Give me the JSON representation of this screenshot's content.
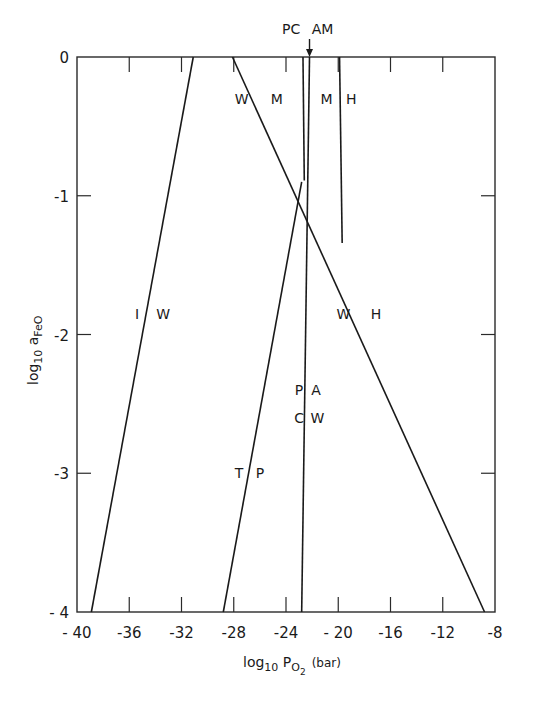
{
  "chart_data": {
    "type": "line",
    "title": "",
    "xlabel": "log10 PO2 (bar)",
    "xlabel_parts": {
      "main": "log",
      "sub1": "10",
      "mid": " P",
      "sub2": "O",
      "sub3": "2",
      "unit": "(bar)"
    },
    "ylabel": "log10 aFeO",
    "ylabel_parts": {
      "main": "log",
      "sub1": "10",
      "mid": " a",
      "sub2": "FeO"
    },
    "xlim": [
      -40,
      -8
    ],
    "ylim": [
      -4,
      0
    ],
    "grid": false,
    "x_ticks": [
      -40,
      -36,
      -32,
      -28,
      -24,
      -20,
      -16,
      -12,
      -8
    ],
    "x_tick_labels": [
      "- 40",
      "-36",
      "-32",
      "-28",
      "-24",
      "- 20",
      "-16",
      "-12",
      "-8"
    ],
    "y_ticks": [
      0,
      -1,
      -2,
      -3,
      -4
    ],
    "y_tick_labels": [
      "0",
      "-1",
      "-2",
      "-3",
      "- 4"
    ],
    "series": [
      {
        "name": "I/W boundary",
        "points": [
          [
            -31.1,
            0
          ],
          [
            -38.9,
            -4
          ]
        ]
      },
      {
        "name": "W/M - W/H boundary",
        "points": [
          [
            -28.1,
            0
          ],
          [
            -8.8,
            -4
          ]
        ]
      },
      {
        "name": "T/P boundary",
        "points": [
          [
            -22.8,
            -0.9
          ],
          [
            -28.8,
            -4
          ]
        ]
      },
      {
        "name": "PC/AM - PA/CW boundary",
        "points": [
          [
            -22.2,
            0
          ],
          [
            -22.8,
            -4
          ]
        ]
      },
      {
        "name": "W M / M boundary",
        "points": [
          [
            -22.7,
            0
          ],
          [
            -22.6,
            -0.89
          ]
        ]
      },
      {
        "name": "M/H boundary",
        "points": [
          [
            -19.9,
            0
          ],
          [
            -19.7,
            -1.34
          ]
        ]
      }
    ],
    "annotations": [
      {
        "text": "PC",
        "x": -23.6,
        "y": 0.2
      },
      {
        "text": "AM",
        "x": -21.2,
        "y": 0.2
      },
      {
        "text": "arrow",
        "x": -22.2,
        "y": 0.1
      },
      {
        "text": "W",
        "x": -27.4,
        "y": -0.3
      },
      {
        "text": "M",
        "x": -24.7,
        "y": -0.3
      },
      {
        "text": "M",
        "x": -20.9,
        "y": -0.3
      },
      {
        "text": "H",
        "x": -19.0,
        "y": -0.3
      },
      {
        "text": "I",
        "x": -35.4,
        "y": -1.85
      },
      {
        "text": "W",
        "x": -33.4,
        "y": -1.85
      },
      {
        "text": "W",
        "x": -19.6,
        "y": -1.85
      },
      {
        "text": "H",
        "x": -17.1,
        "y": -1.85
      },
      {
        "text": "P",
        "x": -23.0,
        "y": -2.4
      },
      {
        "text": "A",
        "x": -21.7,
        "y": -2.4
      },
      {
        "text": "C",
        "x": -23.0,
        "y": -2.6
      },
      {
        "text": "W",
        "x": -21.6,
        "y": -2.6
      },
      {
        "text": "T",
        "x": -27.6,
        "y": -3.0
      },
      {
        "text": "P",
        "x": -26.0,
        "y": -3.0
      }
    ]
  }
}
